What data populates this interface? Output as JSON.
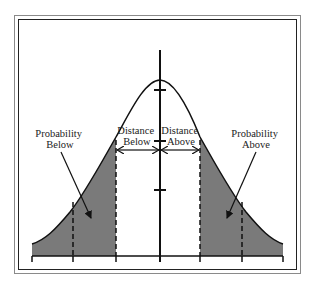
{
  "diagram": {
    "type": "normal-distribution",
    "labels": {
      "probability_below": [
        "Probability",
        "Below"
      ],
      "distance_below": [
        "Distance",
        "Below"
      ],
      "distance_above": [
        "Distance",
        "Above"
      ],
      "probability_above": [
        "Probability",
        "Above"
      ]
    },
    "colors": {
      "shading": "#7a7a7a",
      "line": "#111111",
      "frame_outer": "#8a8a8a",
      "frame_inner": "#222222"
    },
    "x_ticks": [
      32,
      73,
      116,
      160,
      200,
      242,
      283
    ],
    "y_axis_ticks": [
      90,
      141,
      190
    ],
    "dashed_lines": [
      73,
      116,
      200,
      242
    ]
  }
}
